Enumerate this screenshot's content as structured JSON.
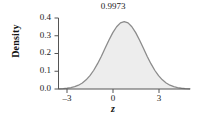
{
  "chart_data": {
    "type": "area",
    "title": "",
    "subtitle": "",
    "xlabel": "z",
    "ylabel": "Density",
    "xlim": [
      -3.45,
      3.45
    ],
    "ylim": [
      0.0,
      0.42
    ],
    "grid": false,
    "legend": null,
    "x_ticks": [
      "–3",
      "0",
      "3"
    ],
    "x_tick_values": [
      -3,
      0,
      3
    ],
    "y_ticks": [
      "0.0",
      "0.1",
      "0.2",
      "0.3",
      "0.4"
    ],
    "y_tick_values": [
      0.0,
      0.1,
      0.2,
      0.3,
      0.4
    ],
    "annotations": [
      {
        "text": "0.9973",
        "x": 0,
        "y": 0.4
      }
    ],
    "series": [
      {
        "name": "standard normal density",
        "distribution": "normal",
        "mean": 0,
        "sd": 1,
        "fill_color": "#ededed",
        "line_color": "#8c8c8c",
        "x": [
          -3.45,
          -3.2,
          -3.0,
          -2.8,
          -2.6,
          -2.4,
          -2.2,
          -2.0,
          -1.8,
          -1.6,
          -1.4,
          -1.2,
          -1.0,
          -0.8,
          -0.6,
          -0.4,
          -0.2,
          0.0,
          0.2,
          0.4,
          0.6,
          0.8,
          1.0,
          1.2,
          1.4,
          1.6,
          1.8,
          2.0,
          2.2,
          2.4,
          2.6,
          2.8,
          3.0,
          3.2,
          3.45
        ],
        "values": [
          0.001,
          0.0024,
          0.0044,
          0.0079,
          0.0136,
          0.0224,
          0.0355,
          0.054,
          0.079,
          0.1109,
          0.1497,
          0.1942,
          0.242,
          0.2897,
          0.3332,
          0.3683,
          0.391,
          0.3989,
          0.391,
          0.3683,
          0.3332,
          0.2897,
          0.242,
          0.1942,
          0.1497,
          0.1109,
          0.079,
          0.054,
          0.0355,
          0.0224,
          0.0136,
          0.0079,
          0.0044,
          0.0024,
          0.001
        ]
      }
    ]
  },
  "axes": {
    "y_title": "Density",
    "x_title": "z"
  },
  "colors": {
    "fill": "#ededed",
    "curve": "#8c8c8c",
    "axis": "#555555",
    "text": "#1a1a1a",
    "background": "#ffffff"
  }
}
